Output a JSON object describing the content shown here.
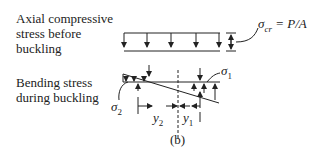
{
  "labels": {
    "axial_line1": "Axial compressive",
    "axial_line2": "stress before",
    "axial_line3": "buckling",
    "bending_line1": "Bending stress",
    "bending_line2": "during buckling"
  },
  "symbols": {
    "sigma_cr": "σcr = P/A",
    "sigma_cr_base": "σ",
    "sigma_cr_sub": "cr",
    "sigma_cr_rhs": " = P/A",
    "sigma1_base": "σ",
    "sigma1_sub": "1",
    "sigma2_base": "σ",
    "sigma2_sub": "2",
    "y1_base": "y",
    "y1_sub": "1",
    "y2_base": "y",
    "y2_sub": "2"
  },
  "caption": "(b)"
}
